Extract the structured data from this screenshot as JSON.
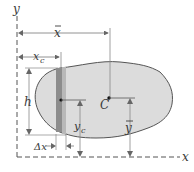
{
  "diagram": {
    "type": "centroid-of-area",
    "labels": {
      "y_axis": "y",
      "x_axis": "x",
      "x_bar": "x",
      "x_c": "x",
      "x_c_sub": "c",
      "h": "h",
      "centroid": "C",
      "y_bar": "y",
      "y_c": "y",
      "y_c_sub": "c",
      "delta_x": "Δx"
    },
    "colors": {
      "region_fill": "#d9d9d9",
      "strip_fill": "#8a8a8a",
      "strip_light": "#bdbdbd",
      "outline": "#555555",
      "axis": "#555555",
      "dimension": "#777777"
    }
  }
}
